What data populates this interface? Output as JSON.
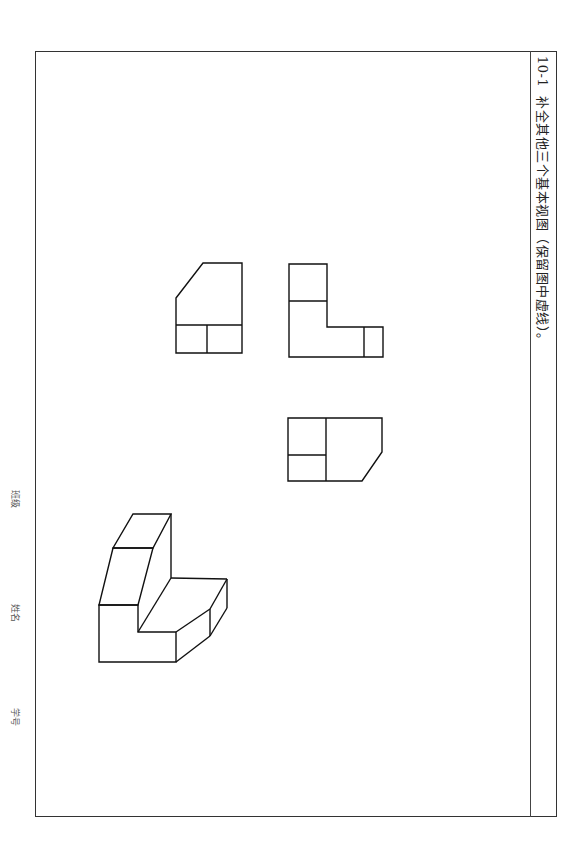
{
  "exercise": {
    "number": "10-1",
    "instruction": "补全其他三个基本视图（保留图中虚线）。"
  },
  "side_labels": {
    "class": "班级",
    "name": "姓名",
    "student_id": "学号"
  },
  "colors": {
    "line": "#111111",
    "frame": "#333333",
    "background": "#ffffff"
  },
  "figures": [
    {
      "id": "view-left",
      "type": "orthographic-view"
    },
    {
      "id": "view-front",
      "type": "orthographic-view"
    },
    {
      "id": "view-bottom",
      "type": "orthographic-view"
    },
    {
      "id": "isometric",
      "type": "isometric-drawing"
    }
  ]
}
